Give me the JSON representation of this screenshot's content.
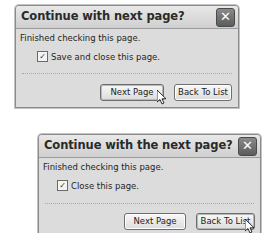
{
  "dialogs": [
    {
      "title": "Continue with next page?",
      "message": "Finished checking this page.",
      "checkbox": {
        "label": "Save and close this page.",
        "checked": true,
        "glyph": "✓"
      },
      "buttons": {
        "next": "Next Page",
        "back": "Back To List"
      },
      "close_glyph": "✕",
      "cursor_over": "Next Page"
    },
    {
      "title": "Continue with the next page?",
      "message": "Finished checking this page.",
      "checkbox": {
        "label": "Close this page.",
        "checked": true,
        "glyph": "✓"
      },
      "buttons": {
        "next": "Next Page",
        "back": "Back To List"
      },
      "close_glyph": "✕",
      "cursor_over": "Back To List"
    }
  ]
}
